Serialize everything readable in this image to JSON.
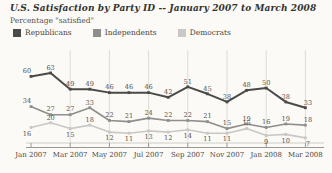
{
  "header": {
    "title": "U.S. Satisfaction by Party ID -- January 2007 to March 2008",
    "subtitle": "Percentage \"satisfied\""
  },
  "legend": {
    "items": [
      {
        "label": "Republicans",
        "color": "#4a4a48"
      },
      {
        "label": "Independents",
        "color": "#8e8e8c"
      },
      {
        "label": "Democrats",
        "color": "#c9c8c4"
      }
    ]
  },
  "chart_data": {
    "type": "line",
    "title": "U.S. Satisfaction by Party ID -- January 2007 to March 2008",
    "subtitle": "Percentage \"satisfied\"",
    "x": [
      "Jan 2007",
      "Feb 2007",
      "Mar 2007",
      "Apr 2007",
      "May 2007",
      "Jun 2007",
      "Jul 2007",
      "Aug 2007",
      "Sep 2007",
      "Oct 2007",
      "Nov 2007",
      "Dec 2007",
      "Jan 2008",
      "Feb 2008",
      "Mar 2008"
    ],
    "x_tick_labels": [
      "Jan 2007",
      "Mar 2007",
      "May 2007",
      "Jul 2007",
      "Sep 2007",
      "Nov 2007",
      "Jan 2008",
      "Mar 2008"
    ],
    "series": [
      {
        "name": "Republicans",
        "color": "#4a4a48",
        "line_width": 2,
        "values": [
          60,
          63,
          49,
          49,
          46,
          46,
          46,
          42,
          51,
          45,
          38,
          48,
          50,
          38,
          33
        ],
        "label_side": [
          "above",
          "above",
          "above",
          "above",
          "above",
          "above",
          "above",
          "above",
          "above",
          "above",
          "above",
          "above",
          "above",
          "above",
          "above"
        ]
      },
      {
        "name": "Independents",
        "color": "#8e8e8c",
        "line_width": 1.6,
        "values": [
          34,
          27,
          27,
          33,
          22,
          21,
          24,
          22,
          22,
          21,
          15,
          19,
          16,
          19,
          18
        ],
        "label_side": [
          "above",
          "above",
          "above",
          "above",
          "above",
          "above",
          "above",
          "above",
          "above",
          "above",
          "above",
          "above",
          "above",
          "above",
          "above"
        ]
      },
      {
        "name": "Democrats",
        "color": "#c9c8c4",
        "line_width": 1.6,
        "values": [
          16,
          20,
          15,
          18,
          12,
          11,
          13,
          12,
          14,
          11,
          11,
          15,
          9,
          10,
          7
        ],
        "label_side": [
          "below",
          "above",
          "below",
          "above",
          "below",
          "below",
          "below",
          "below",
          "below",
          "below",
          "below",
          "above",
          "below",
          "below",
          "below"
        ]
      }
    ],
    "ylim": [
      0,
      70
    ],
    "grid": "vertical-at-labeled-ticks",
    "legend_position": "top-left",
    "label_color": "#55524e",
    "gridline_color": "#dedcd7",
    "axis_line_light": "#cfccc6",
    "axis_line_dark": "#9a9792"
  }
}
